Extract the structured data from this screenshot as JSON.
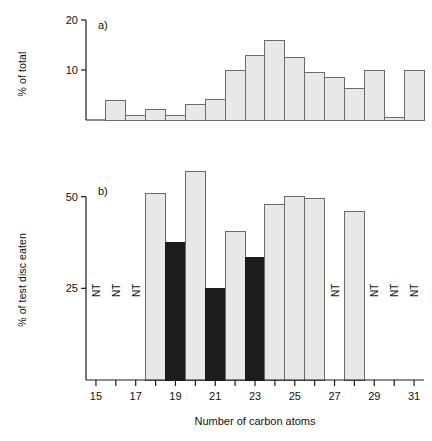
{
  "figure": {
    "xlabel": "Number of carbon atoms",
    "panels": [
      {
        "tag": "a)",
        "ylabel": "% of total",
        "yticks": [
          "10",
          "20"
        ]
      },
      {
        "tag": "b)",
        "ylabel": "% of test disc eaten",
        "yticks": [
          "25",
          "50"
        ]
      }
    ],
    "xticks": [
      "15",
      "17",
      "19",
      "21",
      "23",
      "25",
      "27",
      "29",
      "31"
    ],
    "nt_label": "NT"
  },
  "colors": {
    "bar_light": "#e8e8e8",
    "bar_dark": "#1c1c1c",
    "bar_stroke": "#6b6b6b",
    "axis": "#1a1a1a",
    "text": "#111111",
    "background": "#ffffff"
  },
  "chart_data": [
    {
      "type": "bar",
      "title": "a)",
      "xlabel": "Number of carbon atoms",
      "ylabel": "% of total",
      "ylim": [
        0,
        20
      ],
      "xlim": [
        14.5,
        31.5
      ],
      "yticks": [
        10,
        20
      ],
      "xticks": [
        15,
        16,
        17,
        18,
        19,
        20,
        21,
        22,
        23,
        24,
        25,
        26,
        27,
        28,
        29,
        30,
        31
      ],
      "xticklabels_shown": [
        15,
        17,
        19,
        21,
        23,
        25,
        27,
        29,
        31
      ],
      "grid": false,
      "legend": null,
      "categories": [
        16,
        17,
        18,
        19,
        20,
        21,
        22,
        23,
        24,
        25,
        26,
        27,
        28,
        29,
        30,
        31
      ],
      "values": [
        4.0,
        1.0,
        2.2,
        1.0,
        3.2,
        4.2,
        10.0,
        13.0,
        16.0,
        12.5,
        9.5,
        8.5,
        6.3,
        10.0,
        0.6,
        10.0
      ]
    },
    {
      "type": "bar",
      "title": "b)",
      "xlabel": "Number of carbon atoms",
      "ylabel": "% of test disc eaten",
      "ylim": [
        0,
        60
      ],
      "xlim": [
        14.5,
        31.5
      ],
      "yticks": [
        25,
        50
      ],
      "xticks": [
        15,
        16,
        17,
        18,
        19,
        20,
        21,
        22,
        23,
        24,
        25,
        26,
        27,
        28,
        29,
        30,
        31
      ],
      "xticklabels_shown": [
        15,
        17,
        19,
        21,
        23,
        25,
        27,
        29,
        31
      ],
      "grid": false,
      "legend": null,
      "categories": [
        15,
        16,
        17,
        18,
        19,
        20,
        21,
        22,
        23,
        24,
        25,
        26,
        27,
        28,
        29,
        30,
        31
      ],
      "values": [
        null,
        null,
        null,
        51.0,
        37.5,
        57.0,
        25.0,
        40.5,
        33.5,
        48.0,
        50.0,
        49.5,
        null,
        46.0,
        null,
        null,
        null
      ],
      "bar_shade": [
        "none",
        "none",
        "none",
        "light",
        "dark",
        "light",
        "dark",
        "light",
        "dark",
        "light",
        "light",
        "light",
        "none",
        "light",
        "none",
        "none",
        "none"
      ],
      "not_tested": [
        15,
        16,
        17,
        27,
        29,
        30,
        31
      ],
      "not_tested_label": "NT"
    }
  ]
}
